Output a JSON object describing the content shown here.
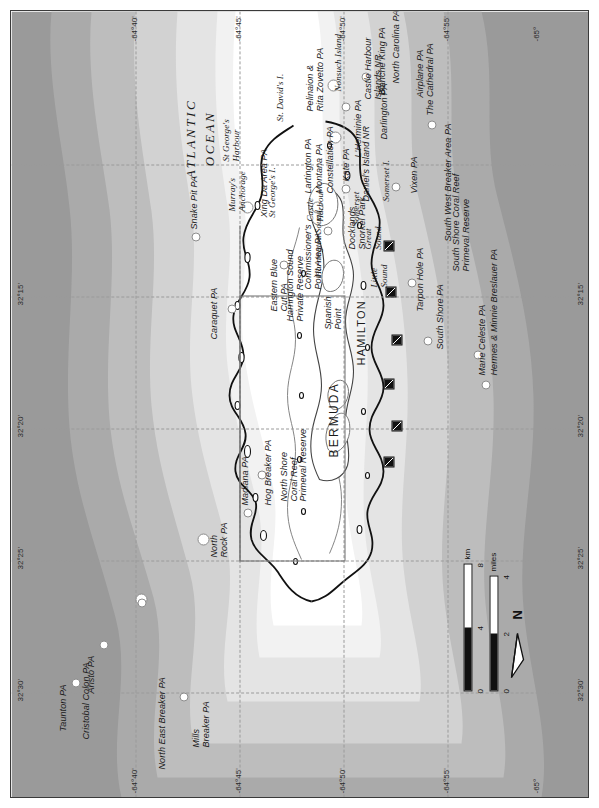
{
  "map": {
    "title": "Bermuda Marine Protected Areas and Dive Sites",
    "orientation_note": "map printed rotated 90 degrees; north points to the right of the page",
    "ocean_label": "ATLANTIC\nOCEAN",
    "ocean_label_line1": "ATLANTIC",
    "ocean_label_line2": "OCEAN",
    "island_label": "BERMUDA",
    "capital_label": "HAMILTON"
  },
  "colors": {
    "land": "#ffffff",
    "shelf": "#f2f2f2",
    "depth_band_1": "#e4e4e4",
    "depth_band_2": "#d2d2d2",
    "depth_band_3": "#bdbdbd",
    "depth_band_4": "#aaaaaa",
    "depth_band_5": "#9a9a9a",
    "reef_line": "#111111",
    "graticule": "#9a9a9a",
    "symbol_outline": "#8d8d8d",
    "text": "#1a1a1a",
    "frame": "#3a3a3a"
  },
  "graticule": {
    "latitude_labels": [
      "32°30'",
      "32°25'",
      "32°20'",
      "32°15'"
    ],
    "longitude_labels": [
      "-64°40'",
      "-64°45'",
      "-64°50'",
      "-64°55'",
      "-65°"
    ],
    "top_edge_labels": [
      "32°30'",
      "32°25'",
      "32°20'",
      "32°15'"
    ],
    "bottom_edge_labels": [
      "32°30'",
      "32°25'",
      "32°20'",
      "32°15'"
    ],
    "left_edge_labels": [
      "-64°40'",
      "-64°45'",
      "-64°50'",
      "-64°55'",
      "-65°"
    ],
    "right_edge_labels": [
      "-64°40'",
      "-64°45'",
      "-64°50'",
      "-64°55'",
      "-65°"
    ]
  },
  "scale_bar": {
    "km": {
      "unit": "km",
      "ticks": [
        "0",
        "4",
        "8"
      ]
    },
    "miles": {
      "unit": "miles",
      "ticks": [
        "0",
        "2",
        "4"
      ]
    }
  },
  "north_arrow": {
    "label": "N"
  },
  "protected_areas": [
    {
      "name": "Taunton PA"
    },
    {
      "name": "Cristobal Colon PA"
    },
    {
      "name": "Aristo PA"
    },
    {
      "name": "Mills Breaker PA"
    },
    {
      "name": "North East Breaker PA"
    },
    {
      "name": "North Rock PA"
    },
    {
      "name": "Madiana PA"
    },
    {
      "name": "Hog Breaker PA"
    },
    {
      "name": "Caraquet PA"
    },
    {
      "name": "Snake Pit PA"
    },
    {
      "name": "Xing Da Area PA"
    },
    {
      "name": "Eastern Blue Cut PA"
    },
    {
      "name": "Lartington PA"
    },
    {
      "name": "Montana PA"
    },
    {
      "name": "Constellation PA"
    },
    {
      "name": "Commissioner's Point Area PA"
    },
    {
      "name": "L'Herminie PA"
    },
    {
      "name": "Darlington PA"
    },
    {
      "name": "Blanche King PA"
    },
    {
      "name": "North Carolina PA"
    },
    {
      "name": "Airplane PA"
    },
    {
      "name": "Vixen PA"
    },
    {
      "name": "South West Breaker PA"
    },
    {
      "name": "Marie Celeste PA"
    },
    {
      "name": "Hermes & Minnie Breslauer PA"
    },
    {
      "name": "South Shore PA"
    },
    {
      "name": "Tarpon Hole PA"
    },
    {
      "name": "Kate PA"
    },
    {
      "name": "The Cathedral PA"
    },
    {
      "name": "Pelinaion & Rita Zovetto PA"
    }
  ],
  "reserves": [
    {
      "name": "North Shore Coral Reef Primeval Reserve"
    },
    {
      "name": "South Shore Coral Reef Primeval Reserve"
    },
    {
      "name": "Harrington Sound Private Reserve"
    },
    {
      "name": "Castle Harbour Islands NR"
    },
    {
      "name": "Daniel's Island NR"
    },
    {
      "name": "Docklands Snorkel Park"
    }
  ],
  "place_names": [
    {
      "name": "St George's Harbour"
    },
    {
      "name": "St. David's I."
    },
    {
      "name": "St George's I."
    },
    {
      "name": "Murray's Anchorage"
    },
    {
      "name": "Castle Harbour"
    },
    {
      "name": "Nonsuch Island"
    },
    {
      "name": "Harrington Sound"
    },
    {
      "name": "Spanish Point"
    },
    {
      "name": "Somerset"
    },
    {
      "name": "Somerset I."
    },
    {
      "name": "Great Sound"
    },
    {
      "name": "Little Sound"
    }
  ],
  "labels": {
    "taunton_pa": "Taunton PA",
    "cristobal_colon_pa": "Cristobal Colon PA",
    "aristo_pa": "Aristo PA",
    "mills_breaker_pa": "Mills\nBreaker PA",
    "mills_breaker_pa_l1": "Mills",
    "mills_breaker_pa_l2": "Breaker PA",
    "north_east_breaker_pa": "North East Breaker PA",
    "north_rock_pa_l1": "North",
    "north_rock_pa_l2": "Rock PA",
    "madiana_pa": "Madiana PA",
    "hog_breaker_pa": "Hog Breaker PA",
    "caraquet_pa": "Caraquet PA",
    "snake_pit_pa": "Snake Pit PA",
    "xing_da_area_pa": "Xing Da Area PA",
    "eastern_blue_cut_pa_l1": "Eastern Blue",
    "eastern_blue_cut_pa_l2": "Cut PA",
    "lartington_pa": "Lartington PA",
    "montana_pa": "Montana PA",
    "constellation_pa": "Constellation PA",
    "commissioners_point_l1": "Commissioner's",
    "commissioners_point_l2": "Point Area PA",
    "docklands_l1": "Docklands",
    "docklands_l2": "Snorkel Park",
    "daniels_island_nr": "Daniel's Island NR",
    "lherminie_pa": "L'Herminie PA",
    "darlington_pa": "Darlington PA",
    "blanche_king_pa": "Blanche King PA",
    "north_carolina_pa": "North Carolina PA",
    "airplane_pa": "Airplane PA",
    "vixen_pa": "Vixen PA",
    "south_west_breaker_pa": "South West Breaker Area PA",
    "marie_celeste_pa": "Marie Celeste PA",
    "hermes_minnie_pa": "Hermes & Minnie Breslauer PA",
    "south_shore_pa": "South Shore PA",
    "tarpon_hole_pa": "Tarpon Hole PA",
    "kate_pa": "Kate PA",
    "the_cathedral_pa": "The Cathedral PA",
    "pelinaion_l1": "Pelinaion &",
    "pelinaion_l2": "Rita Zovetto PA",
    "nonsuch_island": "Nonsuch Island",
    "castle_harbour_islands_l1": "Castle Harbour",
    "castle_harbour_islands_l2": "Islands NR",
    "north_shore_reserve_l1": "North Shore",
    "north_shore_reserve_l2": "Coral Reef",
    "north_shore_reserve_l3": "Primeval Reserve",
    "south_shore_reserve_l1": "South Shore Coral Reef",
    "south_shore_reserve_l2": "Primeval Reserve",
    "harrington_reserve_l1": "Harrington Sound",
    "harrington_reserve_l2": "Private Reserve",
    "harrington_sound": "Harrington Sound",
    "st_georges_harbour_l1": "St George's",
    "st_georges_harbour_l2": "Harbour",
    "st_davids_island": "St. David's I.",
    "st_georges_island": "St  George's I.",
    "murrays_anchorage_l1": "Murray's",
    "murrays_anchorage_l2": "Anchorage",
    "castle_harbour_l1": "Castle",
    "castle_harbour_l2": "Harbour",
    "spanish_point_l1": "Spanish",
    "spanish_point_l2": "Point",
    "somerset": "Somerset",
    "somerset_island": "Somerset I.",
    "great_sound_l1": "Great",
    "great_sound_l2": "Sound",
    "little_sound_l1": "Little",
    "little_sound_l2": "Sound",
    "bermuda": "BERMUDA",
    "hamilton": "HAMILTON",
    "atlantic_l1": "ATLANTIC",
    "atlantic_l2": "OCEAN"
  }
}
